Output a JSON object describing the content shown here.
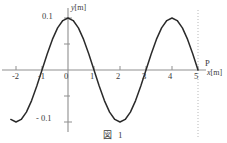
{
  "figure": {
    "caption": "図 1",
    "point_label": "P"
  },
  "axes": {
    "y_axis_label": "y",
    "y_axis_unit": "[m]",
    "x_axis_label": "x",
    "x_axis_unit": "[m]",
    "x_ticks": [
      "-2",
      "-1",
      "0",
      "1",
      "2",
      "3",
      "4",
      "5"
    ],
    "y_ticks": [
      "0.1",
      "- 0.1"
    ],
    "axis_color": "#8a8a8a",
    "curve_color": "#2b2b2b",
    "dotted_line_color": "#b0b0b0"
  },
  "chart_data": {
    "type": "line",
    "title": "図 1",
    "xlabel": "x [m]",
    "ylabel": "y [m]",
    "xlim": [
      -2.3,
      5.6
    ],
    "ylim": [
      -0.13,
      0.13
    ],
    "grid": false,
    "legend": null,
    "annotations": [
      {
        "text": "P",
        "x": 5,
        "y": 0,
        "note": "point P marked at x = 5 m on the x-axis"
      },
      {
        "type": "vertical-dotted-line",
        "x": 5
      }
    ],
    "series": [
      {
        "name": "y = 0.1 cos(pi x / 2)",
        "amplitude": 0.1,
        "wavelength": 4,
        "x": [
          -2.2,
          -2.0,
          -1.8,
          -1.6,
          -1.4,
          -1.2,
          -1.0,
          -0.8,
          -0.6,
          -0.4,
          -0.2,
          0.0,
          0.2,
          0.4,
          0.6,
          0.8,
          1.0,
          1.2,
          1.4,
          1.6,
          1.8,
          2.0,
          2.2,
          2.4,
          2.6,
          2.8,
          3.0,
          3.2,
          3.4,
          3.6,
          3.8,
          4.0,
          4.2,
          4.4,
          4.6,
          4.8,
          5.0
        ],
        "y": [
          -0.0951,
          -0.1,
          -0.0951,
          -0.0809,
          -0.0588,
          -0.0309,
          0.0,
          0.0309,
          0.0588,
          0.0809,
          0.0951,
          0.1,
          0.0951,
          0.0809,
          0.0588,
          0.0309,
          0.0,
          -0.0309,
          -0.0588,
          -0.0809,
          -0.0951,
          -0.1,
          -0.0951,
          -0.0809,
          -0.0588,
          -0.0309,
          0.0,
          0.0309,
          0.0588,
          0.0809,
          0.0951,
          0.1,
          0.0951,
          0.0809,
          0.0588,
          0.0309,
          0.0
        ]
      }
    ],
    "key_points": [
      {
        "x": 0,
        "y": 0.1,
        "kind": "crest"
      },
      {
        "x": -1,
        "y": 0,
        "kind": "zero"
      },
      {
        "x": 1,
        "y": 0,
        "kind": "zero"
      },
      {
        "x": 2,
        "y": -0.1,
        "kind": "trough"
      },
      {
        "x": -2,
        "y": -0.1,
        "kind": "trough"
      },
      {
        "x": 3,
        "y": 0,
        "kind": "zero"
      },
      {
        "x": 4,
        "y": 0.1,
        "kind": "crest"
      },
      {
        "x": 5,
        "y": 0,
        "kind": "zero"
      }
    ]
  }
}
